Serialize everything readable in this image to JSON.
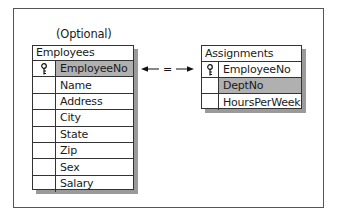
{
  "diagram": {
    "optional_label": "(Optional)",
    "relationship_symbol": "=",
    "tables": {
      "employees": {
        "title": "Employees",
        "fields": [
          {
            "name": "EmployeeNo",
            "key": true,
            "highlighted": true
          },
          {
            "name": "Name",
            "key": false,
            "highlighted": false
          },
          {
            "name": "Address",
            "key": false,
            "highlighted": false
          },
          {
            "name": "City",
            "key": false,
            "highlighted": false
          },
          {
            "name": "State",
            "key": false,
            "highlighted": false
          },
          {
            "name": "Zip",
            "key": false,
            "highlighted": false
          },
          {
            "name": "Sex",
            "key": false,
            "highlighted": false
          },
          {
            "name": "Salary",
            "key": false,
            "highlighted": false
          }
        ]
      },
      "assignments": {
        "title": "Assignments",
        "fields": [
          {
            "name": "EmployeeNo",
            "key": true,
            "highlighted": false
          },
          {
            "name": "DeptNo",
            "key": false,
            "highlighted": true
          },
          {
            "name": "HoursPerWeek",
            "key": false,
            "highlighted": false
          }
        ]
      }
    },
    "icons": {
      "primary_key": "key-icon"
    },
    "colors": {
      "highlight": "#b0b0b0",
      "shadow": "#9a9a9a",
      "border": "#333333"
    }
  }
}
